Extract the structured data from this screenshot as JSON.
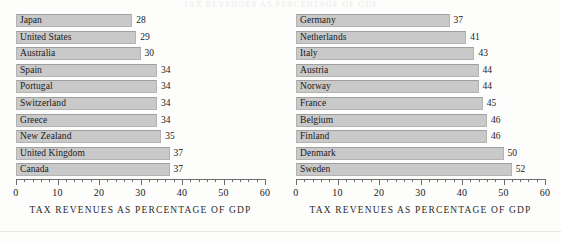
{
  "page": {
    "clipped_title": "TAX REVENUES AS PERCENTAGE OF GDP",
    "background_color": "#fdfdfc",
    "bar_fill_color": "#c9c9c9",
    "bar_border_color": "#b3b3b3",
    "text_color": "#1a1a1a"
  },
  "chart_data": [
    {
      "type": "bar",
      "orientation": "horizontal",
      "title": "",
      "xlabel": "TAX REVENUES AS PERCENTAGE OF GDP",
      "ylabel": "",
      "xlim": [
        0,
        60
      ],
      "xticks": [
        0,
        10,
        20,
        30,
        40,
        50,
        60
      ],
      "xtick_labels": [
        "0",
        "10",
        "20",
        "30",
        "40",
        "50",
        "60"
      ],
      "minor_tick_step": 2,
      "grid": false,
      "legend": false,
      "categories": [
        "Japan",
        "United States",
        "Australia",
        "Spain",
        "Portugal",
        "Switzerland",
        "Greece",
        "New Zealand",
        "United Kingdom",
        "Canada"
      ],
      "values": [
        28,
        29,
        30,
        34,
        34,
        34,
        34,
        35,
        37,
        37
      ],
      "value_labels": [
        "28",
        "29",
        "30",
        "34",
        "34",
        "34",
        "34",
        "35",
        "37",
        "37"
      ]
    },
    {
      "type": "bar",
      "orientation": "horizontal",
      "title": "",
      "xlabel": "TAX REVENUES AS PERCENTAGE OF GDP",
      "ylabel": "",
      "xlim": [
        0,
        60
      ],
      "xticks": [
        0,
        10,
        20,
        30,
        40,
        50,
        60
      ],
      "xtick_labels": [
        "0",
        "10",
        "20",
        "30",
        "40",
        "50",
        "60"
      ],
      "minor_tick_step": 2,
      "grid": false,
      "legend": false,
      "categories": [
        "Germany",
        "Netherlands",
        "Italy",
        "Austria",
        "Norway",
        "France",
        "Belgium",
        "Finland",
        "Denmark",
        "Sweden"
      ],
      "values": [
        37,
        41,
        43,
        44,
        44,
        45,
        46,
        46,
        50,
        52
      ],
      "value_labels": [
        "37",
        "41",
        "43",
        "44",
        "44",
        "45",
        "46",
        "46",
        "50",
        "52"
      ]
    }
  ]
}
